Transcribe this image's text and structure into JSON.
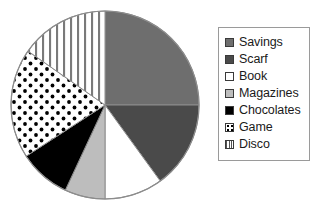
{
  "chart_data": {
    "type": "pie",
    "title": "",
    "categories": [
      "Savings",
      "Scarf",
      "Book",
      "Magazines",
      "Chocolates",
      "Game",
      "Disco"
    ],
    "values": [
      25,
      15,
      10,
      7,
      9,
      19,
      15
    ],
    "units": "percent",
    "angles_deg": [
      90,
      54,
      36,
      25,
      32,
      68,
      55
    ],
    "start_angle_deg": 0,
    "direction": "clockwise",
    "legend_position": "right",
    "grid": false,
    "labels_on_slices": false,
    "slices": [
      {
        "label": "Savings",
        "value": 25,
        "start_deg": 0,
        "end_deg": 90,
        "fill": "#6e6e6e",
        "pattern": "solid"
      },
      {
        "label": "Scarf",
        "value": 15,
        "start_deg": 90,
        "end_deg": 144,
        "fill": "#4a4a4a",
        "pattern": "solid"
      },
      {
        "label": "Book",
        "value": 10,
        "start_deg": 144,
        "end_deg": 180,
        "fill": "#ffffff",
        "pattern": "solid"
      },
      {
        "label": "Magazines",
        "value": 7,
        "start_deg": 180,
        "end_deg": 205,
        "fill": "#bdbdbd",
        "pattern": "solid"
      },
      {
        "label": "Chocolates",
        "value": 9,
        "start_deg": 205,
        "end_deg": 237,
        "fill": "#000000",
        "pattern": "solid"
      },
      {
        "label": "Game",
        "value": 19,
        "start_deg": 237,
        "end_deg": 305,
        "fill": "#ffffff",
        "pattern": "dots"
      },
      {
        "label": "Disco",
        "value": 15,
        "start_deg": 305,
        "end_deg": 360,
        "fill": "#ffffff",
        "pattern": "vertical-stripes"
      }
    ],
    "geometry": {
      "center_x": 105,
      "center_y": 105,
      "radius": 94
    },
    "outline_color": "#8c8c8c"
  },
  "legend": {
    "items": [
      {
        "label": "Savings",
        "swatch": "swatch-solid-gray",
        "fill": "#6e6e6e",
        "pattern": "solid"
      },
      {
        "label": "Scarf",
        "swatch": "swatch-solid-darkgray",
        "fill": "#4a4a4a",
        "pattern": "solid"
      },
      {
        "label": "Book",
        "swatch": "swatch-solid-white",
        "fill": "#ffffff",
        "pattern": "solid"
      },
      {
        "label": "Magazines",
        "swatch": "swatch-solid-lightgray",
        "fill": "#bdbdbd",
        "pattern": "solid"
      },
      {
        "label": "Chocolates",
        "swatch": "swatch-solid-black",
        "fill": "#000000",
        "pattern": "solid"
      },
      {
        "label": "Game",
        "swatch": "swatch-dots",
        "fill": "#ffffff",
        "pattern": "dots"
      },
      {
        "label": "Disco",
        "swatch": "swatch-vertical-stripes",
        "fill": "#ffffff",
        "pattern": "vertical-stripes"
      }
    ]
  }
}
